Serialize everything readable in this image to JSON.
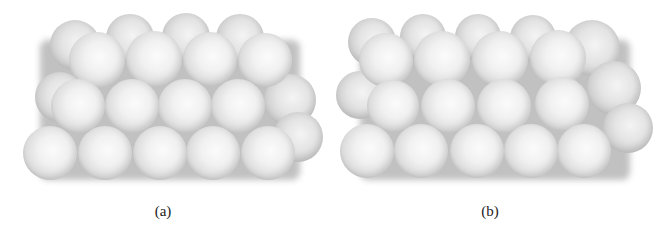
{
  "figure": {
    "panels": [
      {
        "id": "a",
        "label": "(a)",
        "label_pos": [
          163,
          203
        ],
        "shadow_box": [
          40,
          40,
          260,
          140
        ],
        "spheres": [
          {
            "x": 75,
            "y": 45,
            "r": 25,
            "layer": "back"
          },
          {
            "x": 130,
            "y": 38,
            "r": 24,
            "layer": "back"
          },
          {
            "x": 186,
            "y": 37,
            "r": 24,
            "layer": "back"
          },
          {
            "x": 240,
            "y": 38,
            "r": 24,
            "layer": "back"
          },
          {
            "x": 60,
            "y": 97,
            "r": 25,
            "layer": "back"
          },
          {
            "x": 290,
            "y": 100,
            "r": 26,
            "layer": "back"
          },
          {
            "x": 298,
            "y": 137,
            "r": 25,
            "layer": "back"
          },
          {
            "x": 97,
            "y": 60,
            "r": 28,
            "layer": "front"
          },
          {
            "x": 154,
            "y": 59,
            "r": 28,
            "layer": "front"
          },
          {
            "x": 210,
            "y": 59,
            "r": 27,
            "layer": "front"
          },
          {
            "x": 265,
            "y": 60,
            "r": 27,
            "layer": "front"
          },
          {
            "x": 78,
            "y": 106,
            "r": 27,
            "layer": "front"
          },
          {
            "x": 132,
            "y": 106,
            "r": 27,
            "layer": "front"
          },
          {
            "x": 185,
            "y": 106,
            "r": 27,
            "layer": "front"
          },
          {
            "x": 238,
            "y": 106,
            "r": 27,
            "layer": "front"
          },
          {
            "x": 50,
            "y": 153,
            "r": 27,
            "layer": "front"
          },
          {
            "x": 105,
            "y": 153,
            "r": 27,
            "layer": "front"
          },
          {
            "x": 160,
            "y": 153,
            "r": 27,
            "layer": "front"
          },
          {
            "x": 213,
            "y": 153,
            "r": 27,
            "layer": "front"
          },
          {
            "x": 268,
            "y": 153,
            "r": 27,
            "layer": "front"
          }
        ]
      },
      {
        "id": "b",
        "label": "(b)",
        "label_pos": [
          490,
          203
        ],
        "shadow_box": [
          360,
          40,
          270,
          140
        ],
        "spheres": [
          {
            "x": 372,
            "y": 42,
            "r": 24,
            "layer": "back"
          },
          {
            "x": 423,
            "y": 37,
            "r": 23,
            "layer": "back"
          },
          {
            "x": 478,
            "y": 37,
            "r": 23,
            "layer": "back"
          },
          {
            "x": 533,
            "y": 38,
            "r": 23,
            "layer": "back"
          },
          {
            "x": 592,
            "y": 48,
            "r": 28,
            "layer": "back"
          },
          {
            "x": 360,
            "y": 95,
            "r": 24,
            "layer": "back"
          },
          {
            "x": 614,
            "y": 88,
            "r": 27,
            "layer": "back"
          },
          {
            "x": 628,
            "y": 128,
            "r": 25,
            "layer": "back"
          },
          {
            "x": 386,
            "y": 60,
            "r": 27,
            "layer": "front"
          },
          {
            "x": 442,
            "y": 59,
            "r": 28,
            "layer": "front"
          },
          {
            "x": 500,
            "y": 59,
            "r": 28,
            "layer": "front"
          },
          {
            "x": 558,
            "y": 58,
            "r": 28,
            "layer": "front"
          },
          {
            "x": 393,
            "y": 106,
            "r": 26,
            "layer": "front"
          },
          {
            "x": 448,
            "y": 106,
            "r": 27,
            "layer": "front"
          },
          {
            "x": 504,
            "y": 106,
            "r": 27,
            "layer": "front"
          },
          {
            "x": 562,
            "y": 104,
            "r": 27,
            "layer": "front"
          },
          {
            "x": 367,
            "y": 151,
            "r": 27,
            "layer": "front"
          },
          {
            "x": 421,
            "y": 151,
            "r": 27,
            "layer": "front"
          },
          {
            "x": 477,
            "y": 151,
            "r": 27,
            "layer": "front"
          },
          {
            "x": 531,
            "y": 151,
            "r": 27,
            "layer": "front"
          },
          {
            "x": 584,
            "y": 151,
            "r": 27,
            "layer": "front"
          }
        ]
      }
    ]
  }
}
